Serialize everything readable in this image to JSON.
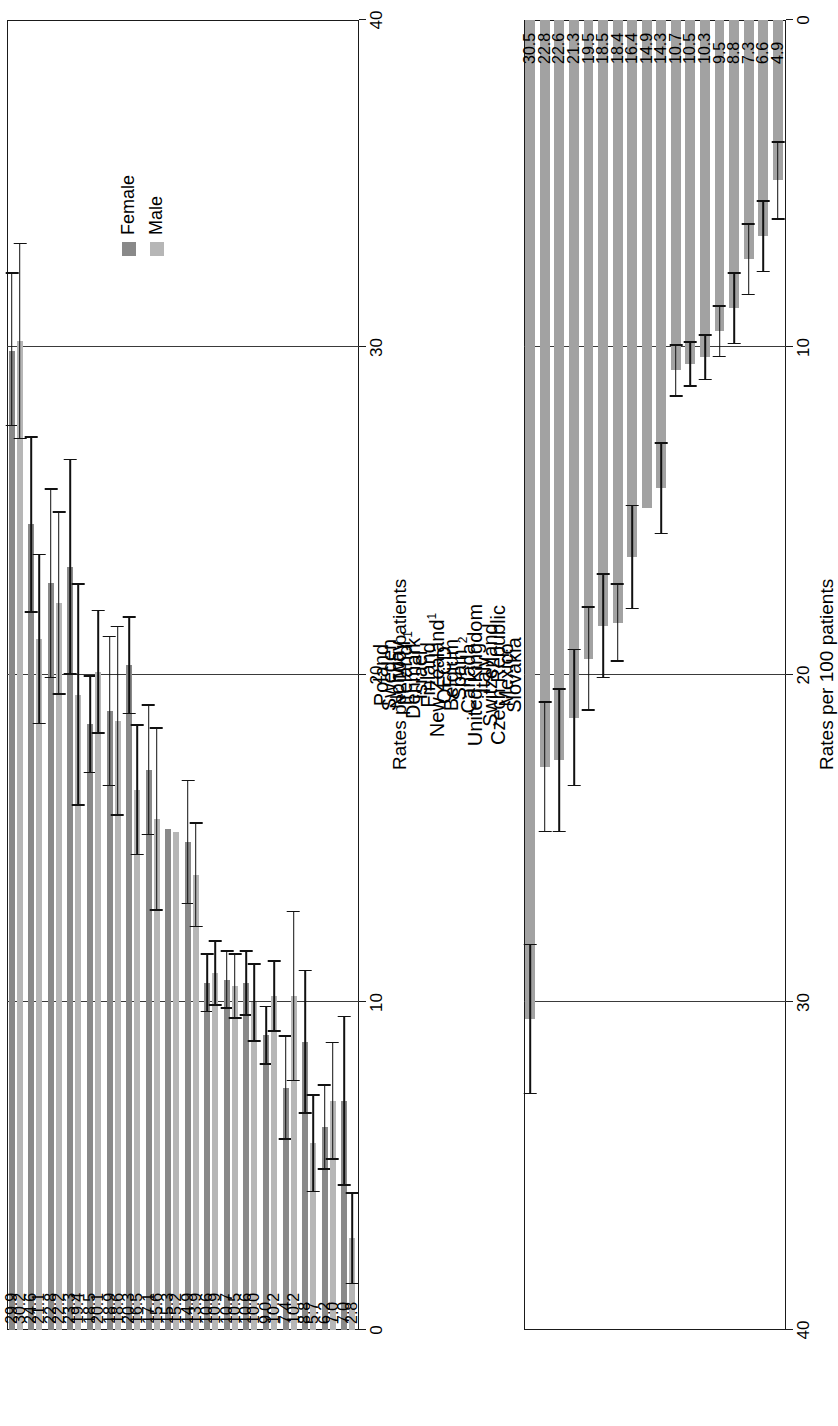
{
  "chart_data": [
    {
      "id": "by-sex",
      "type": "bar",
      "orientation": "horizontal",
      "title": "",
      "xlabel": "",
      "ylabel": "Rates per 100 patients",
      "axis_title": "Rates per 100 patients",
      "xlim": [
        0,
        40
      ],
      "ticks": [
        "0",
        "10",
        "20",
        "30",
        "40"
      ],
      "tick_values": [
        0,
        10,
        20,
        30,
        40
      ],
      "grid": true,
      "grid_at": [
        10,
        20,
        30
      ],
      "legend_position": "top-right",
      "legend": [
        "Female",
        "Male"
      ],
      "categories": [
        "Poland",
        "Sweden",
        "Norway",
        "Ireland",
        "Denmark",
        "Israel",
        "Finland",
        "New Zealand",
        "OECD",
        "Belgium",
        "Spain",
        "Canada",
        "United Kingdom",
        "Italy",
        "Switzerland",
        "Czech Republic",
        "Mexico",
        "Slovakia"
      ],
      "category_footnotes": {
        "Denmark": "1",
        "New Zealand": "1",
        "Canada": "2"
      },
      "series": [
        {
          "name": "Female",
          "color": "#898989",
          "values": [
            29.9,
            24.6,
            22.8,
            23.3,
            18.5,
            18.9,
            20.3,
            17.1,
            15.3,
            14.9,
            10.6,
            10.7,
            10.6,
            9.0,
            7.4,
            8.8,
            6.2,
            7.0
          ],
          "value_labels": [
            "29.9",
            "24.6",
            "22.8",
            "23.3",
            "18.5",
            "18.9",
            "20.3",
            "17.1",
            "15.3",
            "14.9",
            "10.6",
            "10.7",
            "10.6",
            "9.0",
            "7.4",
            "8.8",
            "6.2",
            "7.0"
          ],
          "ci_low": [
            27.6,
            21.9,
            19.9,
            20.0,
            17.0,
            16.6,
            18.8,
            15.1,
            15.3,
            13.0,
            9.7,
            9.8,
            9.6,
            8.1,
            5.8,
            6.6,
            4.9,
            4.4
          ],
          "ci_high": [
            32.3,
            27.3,
            25.7,
            26.6,
            20.0,
            21.2,
            21.8,
            19.1,
            15.3,
            16.8,
            11.5,
            11.6,
            11.6,
            9.9,
            9.0,
            11.0,
            7.5,
            9.6
          ]
        },
        {
          "name": "Male",
          "color": "#b6b6b6",
          "values": [
            30.2,
            21.1,
            22.2,
            19.4,
            20.1,
            18.6,
            16.5,
            15.6,
            15.2,
            13.9,
            10.9,
            10.5,
            10.0,
            10.2,
            10.2,
            5.7,
            7.0,
            2.8
          ],
          "value_labels": [
            "30.2",
            "21.1",
            "22.2",
            "19.4",
            "20.1",
            "18.6",
            "16.5",
            "15.6",
            "15.2",
            "13.9",
            "10.9",
            "10.5",
            "10.0",
            "10.2",
            "10.2",
            "5.7",
            "7.0",
            "2.8"
          ],
          "ci_low": [
            27.2,
            18.5,
            19.4,
            16.0,
            18.2,
            15.7,
            14.5,
            12.8,
            15.2,
            12.3,
            9.9,
            9.5,
            8.8,
            9.1,
            7.6,
            4.2,
            5.2,
            1.4
          ],
          "ci_high": [
            33.2,
            23.7,
            25.0,
            22.8,
            22.0,
            21.5,
            18.5,
            18.4,
            15.2,
            15.5,
            11.9,
            11.5,
            11.2,
            11.3,
            12.8,
            7.2,
            8.8,
            4.2
          ]
        }
      ]
    },
    {
      "id": "total",
      "type": "bar",
      "orientation": "horizontal",
      "title": "",
      "xlabel": "",
      "ylabel": "Rates per 100 patients",
      "axis_title": "Rates per 100 patients",
      "xlim": [
        0,
        40
      ],
      "axis_reversed": true,
      "ticks": [
        "0",
        "10",
        "20",
        "30",
        "40"
      ],
      "tick_values": [
        0,
        10,
        20,
        30,
        40
      ],
      "grid": true,
      "grid_at": [
        10,
        20,
        30
      ],
      "legend": [],
      "categories": [
        "Poland",
        "Sweden",
        "Norway",
        "Ireland",
        "Denmark",
        "Israel",
        "Finland",
        "New Zealand",
        "OECD",
        "Belgium",
        "Spain",
        "Canada",
        "United Kingdom",
        "Italy",
        "Switzerland",
        "Czech Republic",
        "Mexico",
        "Slovakia"
      ],
      "series": [
        {
          "name": "Total",
          "color": "#a2a2a2",
          "values": [
            30.5,
            22.8,
            22.6,
            21.3,
            19.5,
            18.5,
            18.4,
            16.4,
            14.9,
            14.3,
            10.7,
            10.5,
            10.3,
            9.5,
            8.8,
            7.3,
            6.6,
            4.9
          ],
          "value_labels": [
            "30.5",
            "22.8",
            "22.6",
            "21.3",
            "19.5",
            "18.5",
            "18.4",
            "16.4",
            "14.9",
            "14.3",
            "10.7",
            "10.5",
            "10.3",
            "9.5",
            "8.8",
            "7.3",
            "6.6",
            "4.9"
          ],
          "ci_low": [
            28.2,
            20.8,
            20.4,
            19.2,
            17.9,
            16.9,
            17.2,
            14.8,
            14.9,
            12.9,
            9.9,
            9.8,
            9.6,
            8.7,
            7.7,
            6.2,
            5.5,
            3.7
          ],
          "ci_high": [
            32.8,
            24.8,
            24.8,
            23.4,
            21.1,
            20.1,
            19.6,
            18.0,
            14.9,
            15.7,
            11.5,
            11.2,
            11.0,
            10.3,
            9.9,
            8.4,
            7.7,
            6.1
          ]
        }
      ]
    }
  ]
}
